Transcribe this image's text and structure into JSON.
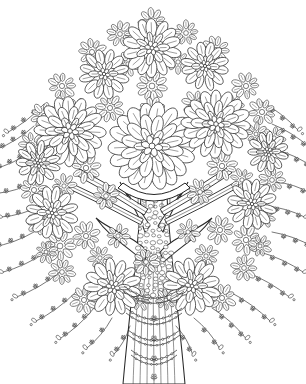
{
  "artwork": {
    "title": "Flowering Tree",
    "subject": "stylized blossoming tree",
    "style": "black-ink line art, coloring-book / zentangle",
    "medium": "pen and ink line drawing",
    "palette": {
      "background": "#ffffff",
      "ink": "#262626",
      "ink_soft": "#3a3a3a",
      "fill": "#ffffff"
    },
    "canvas": {
      "width": 306,
      "height": 384
    },
    "description": "A broad dome-shaped canopy composed of hundreds of overlapping teardrop petals forming chrysanthemum rosettes, above a textured trunk draped with chain garlands and hanging beaded strands."
  },
  "composition": {
    "canopy": {
      "name": "flowering canopy",
      "center_x": 152,
      "center_y": 160,
      "radius_x": 125,
      "radius_y": 150,
      "top_y": 16,
      "bottom_y": 322,
      "left_x": 26,
      "right_x": 276
    },
    "trunk": {
      "name": "tree trunk",
      "center_x": 154,
      "top_y": 196,
      "base_y": 384,
      "top_width": 26,
      "base_width": 62,
      "fork_y": 252,
      "grain_lines": 7
    },
    "ground_line": null
  },
  "chart_data": {
    "type": "scatter",
    "xlabel": "",
    "ylabel": "",
    "xlim": [
      0,
      306
    ],
    "ylim": [
      0,
      384
    ],
    "grid": false,
    "legend": "none",
    "series": [
      {
        "name": "feature-rosettes",
        "note": "large chrysanthemum blooms, [cx, cy, radius, petal_rings, petals_outer]",
        "values": [
          [
            152,
            146,
            40,
            3,
            18
          ],
          [
            70,
            131,
            32,
            3,
            16
          ],
          [
            216,
            124,
            31,
            3,
            16
          ],
          [
            152,
            48,
            27,
            2,
            14
          ],
          [
            113,
            287,
            26,
            2,
            13
          ],
          [
            192,
            286,
            26,
            2,
            13
          ],
          [
            52,
            213,
            24,
            2,
            12
          ],
          [
            252,
            204,
            23,
            2,
            12
          ],
          [
            104,
            74,
            23,
            2,
            12
          ],
          [
            205,
            66,
            22,
            2,
            12
          ],
          [
            38,
            163,
            20,
            2,
            11
          ],
          [
            268,
            152,
            19,
            2,
            11
          ]
        ]
      },
      {
        "name": "filler-clusters",
        "note": "dense small petal clumps, [cx, cy, radius, petals]",
        "values": [
          [
            152,
            22,
            15,
            9
          ],
          [
            120,
            34,
            14,
            9
          ],
          [
            186,
            33,
            14,
            9
          ],
          [
            92,
            52,
            15,
            9
          ],
          [
            216,
            50,
            15,
            9
          ],
          [
            152,
            86,
            17,
            10
          ],
          [
            62,
            86,
            15,
            9
          ],
          [
            246,
            86,
            15,
            9
          ],
          [
            44,
            116,
            15,
            9
          ],
          [
            262,
            112,
            15,
            9
          ],
          [
            110,
            108,
            15,
            9
          ],
          [
            196,
            104,
            15,
            9
          ],
          [
            32,
            145,
            14,
            9
          ],
          [
            274,
            138,
            13,
            8
          ],
          [
            86,
            168,
            16,
            9
          ],
          [
            222,
            166,
            16,
            9
          ],
          [
            34,
            190,
            15,
            9
          ],
          [
            272,
            180,
            14,
            9
          ],
          [
            60,
            246,
            17,
            10
          ],
          [
            246,
            240,
            16,
            9
          ],
          [
            86,
            236,
            15,
            9
          ],
          [
            220,
            230,
            15,
            9
          ],
          [
            146,
            262,
            14,
            9
          ],
          [
            40,
            222,
            14,
            9
          ],
          [
            264,
            216,
            13,
            8
          ],
          [
            84,
            300,
            15,
            9
          ],
          [
            222,
            298,
            15,
            9
          ],
          [
            152,
            112,
            16,
            9
          ],
          [
            128,
            64,
            13,
            8
          ],
          [
            178,
            62,
            13,
            8
          ],
          [
            76,
            110,
            13,
            8
          ],
          [
            232,
            106,
            13,
            8
          ],
          [
            50,
            140,
            12,
            8
          ],
          [
            256,
            134,
            12,
            8
          ],
          [
            106,
            196,
            14,
            9
          ],
          [
            200,
            192,
            14,
            9
          ],
          [
            64,
            186,
            13,
            8
          ],
          [
            242,
            180,
            13,
            8
          ],
          [
            118,
            236,
            13,
            8
          ],
          [
            188,
            232,
            13,
            8
          ],
          [
            62,
            272,
            14,
            9
          ],
          [
            244,
            268,
            14,
            9
          ],
          [
            100,
            258,
            13,
            8
          ],
          [
            206,
            256,
            13,
            8
          ],
          [
            140,
            300,
            12,
            8
          ],
          [
            166,
            300,
            12,
            8
          ],
          [
            46,
            252,
            12,
            8
          ],
          [
            260,
            246,
            12,
            8
          ]
        ]
      },
      {
        "name": "hanging-strands",
        "note": "beaded tassels from canopy rim, [x_start, y_start, angle_deg, length, beads]",
        "values": [
          [
            44,
            104,
            218,
            46,
            3
          ],
          [
            34,
            126,
            212,
            44,
            3
          ],
          [
            30,
            152,
            205,
            40,
            3
          ],
          [
            33,
            182,
            198,
            36,
            2
          ],
          [
            40,
            206,
            196,
            40,
            3
          ],
          [
            34,
            232,
            200,
            44,
            3
          ],
          [
            46,
            252,
            205,
            48,
            3
          ],
          [
            60,
            272,
            210,
            50,
            3
          ],
          [
            76,
            292,
            216,
            50,
            3
          ],
          [
            94,
            308,
            222,
            46,
            3
          ],
          [
            112,
            318,
            230,
            40,
            2
          ],
          [
            130,
            326,
            240,
            34,
            2
          ],
          [
            176,
            326,
            300,
            34,
            2
          ],
          [
            194,
            318,
            310,
            40,
            2
          ],
          [
            212,
            308,
            318,
            46,
            3
          ],
          [
            230,
            292,
            324,
            50,
            3
          ],
          [
            246,
            272,
            330,
            50,
            3
          ],
          [
            260,
            252,
            335,
            48,
            3
          ],
          [
            272,
            232,
            340,
            44,
            3
          ],
          [
            266,
            206,
            344,
            40,
            3
          ],
          [
            276,
            182,
            342,
            36,
            2
          ],
          [
            276,
            150,
            335,
            40,
            3
          ],
          [
            272,
            124,
            328,
            44,
            3
          ],
          [
            262,
            102,
            322,
            46,
            3
          ]
        ]
      },
      {
        "name": "trunk-garlands",
        "note": "draped chains across trunk, [cx, y_anchor, half_width, sag]",
        "values": [
          [
            154,
            286,
            30,
            13
          ],
          [
            154,
            308,
            28,
            12
          ],
          [
            154,
            330,
            26,
            11
          ],
          [
            154,
            350,
            23,
            10
          ]
        ]
      },
      {
        "name": "ribbon-sashes",
        "note": "diagonal ribbon bands from trunk into canopy, [x1,y1,x2,y2,width]",
        "values": [
          [
            146,
            212,
            78,
            172,
            7
          ],
          [
            142,
            222,
            70,
            186,
            6
          ],
          [
            162,
            212,
            230,
            170,
            7
          ],
          [
            166,
            222,
            238,
            184,
            6
          ]
        ]
      },
      {
        "name": "swag-arc",
        "note": "large drape across upper trunk, [cx, y, half_width, depth]",
        "values": [
          [
            154,
            188,
            36,
            18
          ]
        ]
      }
    ]
  },
  "elements": [
    {
      "name": "canopy",
      "label": "flowering canopy",
      "interactable": false
    },
    {
      "name": "trunk",
      "label": "tree trunk",
      "interactable": false
    },
    {
      "name": "rosettes",
      "label": "chrysanthemum blossoms",
      "interactable": false
    },
    {
      "name": "garlands",
      "label": "draped chain garlands",
      "interactable": false
    },
    {
      "name": "tassels",
      "label": "hanging beaded strands",
      "interactable": false
    },
    {
      "name": "ribbons",
      "label": "ribbon sashes",
      "interactable": false
    },
    {
      "name": "swag",
      "label": "swag drape",
      "interactable": false
    }
  ]
}
